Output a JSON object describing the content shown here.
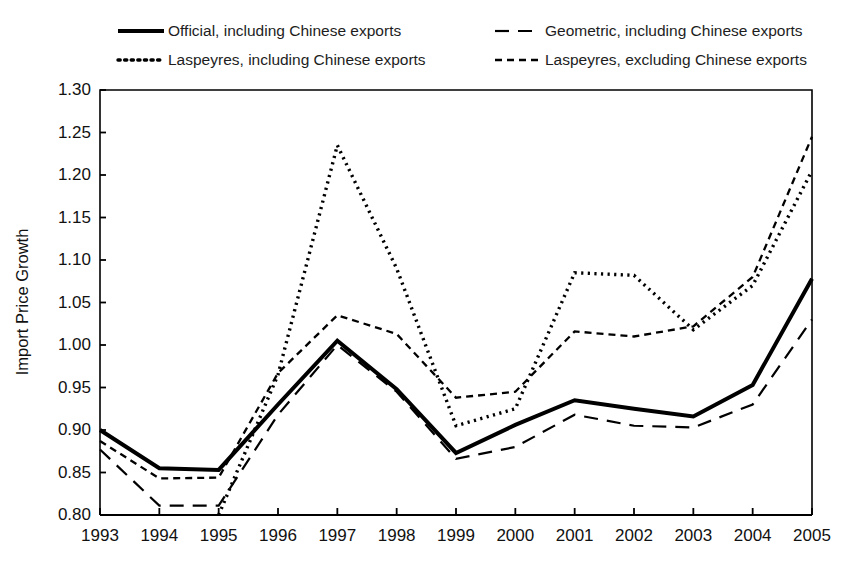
{
  "chart_data": {
    "type": "line",
    "title": "",
    "xlabel": "",
    "ylabel": "Import Price Growth",
    "x": [
      1993,
      1994,
      1995,
      1996,
      1997,
      1998,
      1999,
      2000,
      2001,
      2002,
      2003,
      2004,
      2005
    ],
    "categories": [
      "1993",
      "1994",
      "1995",
      "1996",
      "1997",
      "1998",
      "1999",
      "2000",
      "2001",
      "2002",
      "2003",
      "2004",
      "2005"
    ],
    "xlim": [
      1993,
      2005
    ],
    "ylim": [
      0.8,
      1.3
    ],
    "yticks": [
      "1.30",
      "1.25",
      "1.20",
      "1.15",
      "1.10",
      "1.05",
      "1.00",
      "0.95",
      "0.90",
      "0.85",
      "0.80"
    ],
    "ytick_values": [
      1.3,
      1.25,
      1.2,
      1.15,
      1.1,
      1.05,
      1.0,
      0.95,
      0.9,
      0.85,
      0.8
    ],
    "grid": false,
    "legend_position": "top",
    "series": [
      {
        "name": "Official, including Chinese exports",
        "style": "solid",
        "dash": "none",
        "width": 4.0,
        "color": "#000000",
        "values": [
          0.9,
          0.855,
          0.853,
          0.93,
          1.005,
          0.948,
          0.873,
          0.906,
          0.935,
          0.925,
          0.916,
          0.953,
          1.078
        ]
      },
      {
        "name": "Geometric, including Chinese exports",
        "style": "dashed-long",
        "dash": "14,9",
        "width": 2.2,
        "color": "#000000",
        "values": [
          0.877,
          0.811,
          0.811,
          0.918,
          1.0,
          0.945,
          0.866,
          0.88,
          0.918,
          0.905,
          0.903,
          0.93,
          1.03
        ]
      },
      {
        "name": "Laspeyres, including Chinese exports",
        "style": "dotted",
        "dash": "2.2,4.4",
        "width": 3.4,
        "color": "#000000",
        "values": [
          null,
          null,
          0.8,
          0.965,
          1.235,
          1.09,
          0.905,
          0.925,
          1.085,
          1.082,
          1.018,
          1.07,
          1.205
        ]
      },
      {
        "name": "Laspeyres, excluding Chinese exports",
        "style": "dashed-short",
        "dash": "7,5",
        "width": 2.3,
        "color": "#000000",
        "values": [
          0.887,
          0.843,
          0.844,
          0.967,
          1.035,
          1.013,
          0.938,
          0.945,
          1.016,
          1.01,
          1.022,
          1.08,
          1.245
        ]
      }
    ],
    "legend": [
      {
        "label": "Official, including Chinese exports",
        "style": "solid"
      },
      {
        "label": "Geometric, including Chinese exports",
        "style": "dashed-long"
      },
      {
        "label": "Laspeyres, including Chinese exports",
        "style": "dotted"
      },
      {
        "label": "Laspeyres, excluding Chinese exports",
        "style": "dashed-short"
      }
    ]
  },
  "layout": {
    "plot_left": 100,
    "plot_right": 812,
    "plot_top": 90,
    "plot_bottom": 515
  }
}
